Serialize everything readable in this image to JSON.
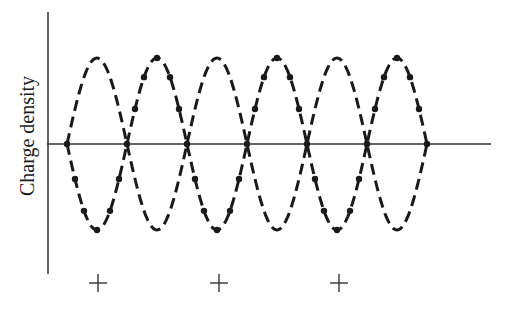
{
  "chart_data": {
    "type": "line",
    "title": "",
    "xlabel": "",
    "ylabel": "Charge density",
    "grid": false,
    "legend": null,
    "axis": {
      "x_axis_y": 144,
      "x_axis_from": 47,
      "x_axis_to": 491,
      "y_axis_x": 48,
      "y_axis_from": 12,
      "y_axis_to": 274
    },
    "wave": {
      "x_start": 67,
      "period_px": 120,
      "cycles": 3,
      "amplitude_px": 86,
      "center_y": 144
    },
    "series": [
      {
        "name": "dashed-wave",
        "style": "dashed",
        "phase_sign": 1,
        "description": "charge density wave, starts rising"
      },
      {
        "name": "dotted-wave",
        "style": "dash-dot",
        "phase_sign": -1,
        "description": "charge density wave shifted by half period, starts falling"
      }
    ],
    "markers": [
      {
        "symbol": "+",
        "x": 98,
        "y": 283
      },
      {
        "symbol": "+",
        "x": 219,
        "y": 283
      },
      {
        "symbol": "+",
        "x": 339,
        "y": 283
      }
    ],
    "colors": {
      "ink": "#1a1a1a",
      "axis": "#333333"
    }
  }
}
